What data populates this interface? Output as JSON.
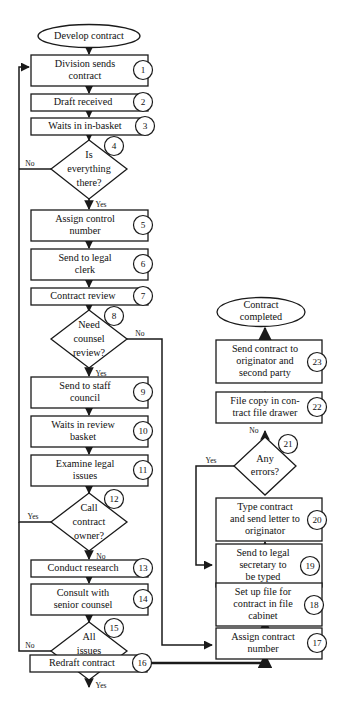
{
  "diagram": {
    "colors": {
      "stroke": "#1a1a1a",
      "fill": "#ffffff",
      "text": "#111111",
      "background": "#ffffff"
    },
    "terminators": [
      {
        "id": "start",
        "label": "Develop contract"
      },
      {
        "id": "end",
        "label": "Contract completed"
      }
    ],
    "steps": [
      {
        "num": "1",
        "type": "process",
        "lines": [
          "Division sends",
          "contract"
        ]
      },
      {
        "num": "2",
        "type": "process",
        "lines": [
          "Draft received"
        ]
      },
      {
        "num": "3",
        "type": "process",
        "lines": [
          "Waits in in-basket"
        ]
      },
      {
        "num": "4",
        "type": "decision",
        "lines": [
          "Is",
          "everything",
          "there?"
        ]
      },
      {
        "num": "5",
        "type": "process",
        "lines": [
          "Assign control",
          "number"
        ]
      },
      {
        "num": "6",
        "type": "process",
        "lines": [
          "Send to legal",
          "clerk"
        ]
      },
      {
        "num": "7",
        "type": "process",
        "lines": [
          "Contract review"
        ]
      },
      {
        "num": "8",
        "type": "decision",
        "lines": [
          "Need",
          "counsel",
          "review?"
        ]
      },
      {
        "num": "9",
        "type": "process",
        "lines": [
          "Send to staff",
          "council"
        ]
      },
      {
        "num": "10",
        "type": "process",
        "lines": [
          "Waits in review",
          "basket"
        ]
      },
      {
        "num": "11",
        "type": "process",
        "lines": [
          "Examine legal",
          "issues"
        ]
      },
      {
        "num": "12",
        "type": "decision",
        "lines": [
          "Call",
          "contract",
          "owner?"
        ]
      },
      {
        "num": "13",
        "type": "process",
        "lines": [
          "Conduct research"
        ]
      },
      {
        "num": "14",
        "type": "process",
        "lines": [
          "Consult with",
          "senior counsel"
        ]
      },
      {
        "num": "15",
        "type": "decision",
        "lines": [
          "All",
          "issues",
          "resolved?"
        ]
      },
      {
        "num": "16",
        "type": "process",
        "lines": [
          "Redraft contract"
        ]
      },
      {
        "num": "17",
        "type": "process",
        "lines": [
          "Assign contract",
          "number"
        ]
      },
      {
        "num": "18",
        "type": "process",
        "lines": [
          "Set up file for",
          "contract in file",
          "cabinet"
        ]
      },
      {
        "num": "19",
        "type": "process",
        "lines": [
          "Send to legal",
          "secretary to",
          "be typed"
        ]
      },
      {
        "num": "20",
        "type": "process",
        "lines": [
          "Type contract",
          "and send letter to",
          "originator"
        ]
      },
      {
        "num": "21",
        "type": "decision",
        "lines": [
          "Any",
          "errors?"
        ]
      },
      {
        "num": "22",
        "type": "process",
        "lines": [
          "File copy in con-",
          "tract file drawer"
        ]
      },
      {
        "num": "23",
        "type": "process",
        "lines": [
          "Send contract to",
          "originator and",
          "second party"
        ]
      }
    ],
    "edge_labels": [
      {
        "id": "d4-no",
        "text": "No",
        "from": "4",
        "to": "1"
      },
      {
        "id": "d4-yes",
        "text": "Yes",
        "from": "4",
        "to": "5"
      },
      {
        "id": "d8-no",
        "text": "No",
        "from": "8",
        "to": "17"
      },
      {
        "id": "d8-yes",
        "text": "Yes",
        "from": "8",
        "to": "9"
      },
      {
        "id": "d12-yes",
        "text": "Yes",
        "from": "12",
        "to": "1"
      },
      {
        "id": "d12-no",
        "text": "No",
        "from": "12",
        "to": "13"
      },
      {
        "id": "d15-no",
        "text": "No",
        "from": "15",
        "to": "1"
      },
      {
        "id": "d15-yes",
        "text": "Yes",
        "from": "15",
        "to": "16"
      },
      {
        "id": "d21-yes",
        "text": "Yes",
        "from": "21",
        "to": "19"
      },
      {
        "id": "d21-no",
        "text": "No",
        "from": "21",
        "to": "22"
      }
    ]
  }
}
